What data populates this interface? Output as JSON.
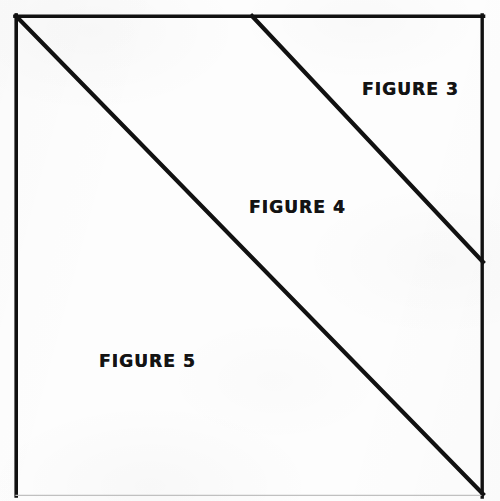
{
  "document": {
    "type": "line-drawing",
    "background_color": "#fdfdfd",
    "ink_color": "#111111",
    "width": 500,
    "height": 501
  },
  "frame": {
    "name": "outer-rectangle",
    "left": 15,
    "top": 15,
    "right": 483,
    "bottom": 495,
    "stroke_width": 3.5,
    "bottom_stroke_width": 1,
    "bottom_stroke_color": "#b9b9b9"
  },
  "lines": [
    {
      "name": "main-diagonal",
      "description": "diagonal from top-left corner to bottom-right corner",
      "x1": 15,
      "y1": 15,
      "x2": 483,
      "y2": 494,
      "stroke_width": 4
    },
    {
      "name": "upper-diagonal",
      "description": "parallel diagonal from top edge to right edge",
      "x1": 252,
      "y1": 15,
      "x2": 483,
      "y2": 262,
      "stroke_width": 4
    }
  ],
  "labels": [
    {
      "id": "figure-3",
      "text": "FIGURE 3",
      "x": 362,
      "y": 78,
      "region": "upper-right triangle"
    },
    {
      "id": "figure-4",
      "text": "FIGURE 4",
      "x": 249,
      "y": 196,
      "region": "middle band"
    },
    {
      "id": "figure-5",
      "text": "FIGURE 5",
      "x": 99,
      "y": 350,
      "region": "lower-left triangle"
    }
  ]
}
